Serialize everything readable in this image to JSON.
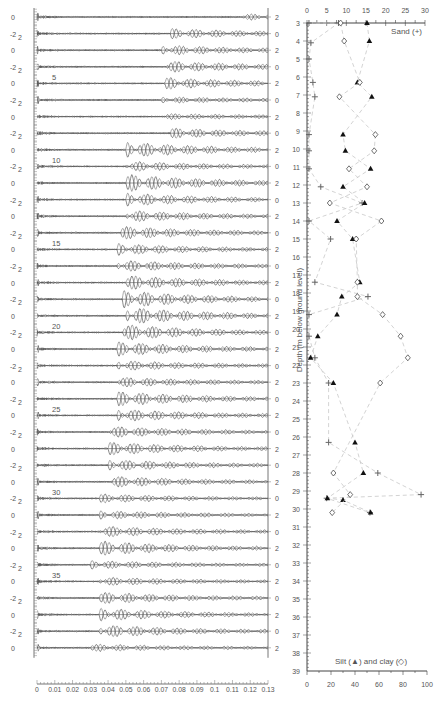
{
  "chart_data": [
    {
      "type": "line",
      "title": "",
      "description": "Stacked seismic waveform traces, one per depth (traces 1-39), amplitude axis -2..2 alternating left/right",
      "xlabel": "",
      "ylabel": "",
      "x_ticks": [
        "0",
        "0.01",
        "0.02",
        "0.03",
        "0.04",
        "0.05",
        "0.06",
        "0.07",
        "0.08",
        "0.09",
        "0.1",
        "0.11",
        "0.12",
        "0.13"
      ],
      "xlim": [
        0,
        0.13
      ],
      "amplitude_ticks": [
        "-2",
        "0",
        "2"
      ],
      "trace_count": 39,
      "trace_labels": [
        "5",
        "10",
        "15",
        "20",
        "25",
        "30",
        "35"
      ],
      "trace_label_indices": [
        5,
        10,
        15,
        20,
        25,
        30,
        35
      ],
      "arrival_time_per_trace": [
        0.115,
        0.075,
        0.07,
        0.072,
        0.072,
        0.07,
        0.07,
        0.075,
        0.05,
        0.05,
        0.05,
        0.05,
        0.05,
        0.047,
        0.045,
        0.045,
        0.05,
        0.048,
        0.05,
        0.048,
        0.045,
        0.045,
        0.045,
        0.045,
        0.045,
        0.04,
        0.04,
        0.04,
        0.04,
        0.035,
        0.035,
        0.035,
        0.035,
        0.03,
        0.035,
        0.035,
        0.035,
        0.035,
        0.03
      ],
      "energy_per_trace": [
        0.2,
        0.5,
        0.5,
        0.6,
        0.6,
        0.2,
        0.2,
        0.5,
        0.9,
        0.5,
        1.0,
        0.7,
        0.6,
        0.7,
        0.6,
        0.6,
        0.8,
        1.0,
        1.0,
        0.9,
        0.8,
        0.5,
        0.5,
        0.8,
        0.7,
        0.6,
        0.7,
        0.6,
        0.6,
        0.4,
        0.4,
        0.6,
        0.8,
        0.4,
        0.4,
        0.6,
        0.7,
        0.7,
        0.3
      ]
    },
    {
      "type": "scatter",
      "title": "",
      "ylabel": "Depth (m below ground level)",
      "ylim": [
        3,
        39
      ],
      "y_ticks": [
        "3",
        "4",
        "5",
        "6",
        "7",
        "8",
        "9",
        "10",
        "11",
        "12",
        "13",
        "14",
        "15",
        "16",
        "17",
        "18",
        "19",
        "20",
        "21",
        "22",
        "23",
        "24",
        "25",
        "26",
        "27",
        "28",
        "29",
        "30",
        "31",
        "32",
        "33",
        "34",
        "35",
        "36",
        "37",
        "38",
        "39"
      ],
      "top_axis": {
        "label": "Sand (+)",
        "range": [
          0,
          30
        ],
        "ticks": [
          "0",
          "5",
          "10",
          "15",
          "20",
          "25",
          "30"
        ]
      },
      "bottom_axis": {
        "label": "Silt (▲) and clay (◇)",
        "range": [
          0,
          100
        ],
        "ticks": [
          "0",
          "20",
          "40",
          "60",
          "80",
          "100"
        ]
      },
      "series": [
        {
          "name": "Sand (+)",
          "axis": "top",
          "marker": "plus",
          "points": [
            [
              0.5,
              3
            ],
            [
              8,
              3
            ],
            [
              1,
              4.1
            ],
            [
              0.5,
              5
            ],
            [
              1.5,
              6.3
            ],
            [
              2,
              7.1
            ],
            [
              0.5,
              9.2
            ],
            [
              0.5,
              10.1
            ],
            [
              0.5,
              11.1
            ],
            [
              3.5,
              12.1
            ],
            [
              14,
              13.0
            ],
            [
              0.5,
              14
            ],
            [
              6,
              15
            ],
            [
              2,
              17.4
            ],
            [
              15.5,
              18.2
            ],
            [
              0.5,
              19.2
            ],
            [
              0.5,
              20.4
            ],
            [
              2,
              21.6
            ],
            [
              5.5,
              23
            ],
            [
              5.5,
              26.3
            ],
            [
              18,
              28
            ],
            [
              29,
              29.2
            ],
            [
              5,
              29.4
            ],
            [
              16,
              30.2
            ]
          ]
        },
        {
          "name": "Silt (▲)",
          "axis": "bottom",
          "marker": "triangle",
          "points": [
            [
              50,
              3
            ],
            [
              52,
              4.0
            ],
            [
              42,
              6.3
            ],
            [
              54,
              7.1
            ],
            [
              30,
              9.2
            ],
            [
              32,
              10.1
            ],
            [
              53,
              11.1
            ],
            [
              30,
              12.1
            ],
            [
              48,
              13.0
            ],
            [
              25,
              14
            ],
            [
              38,
              15
            ],
            [
              44,
              17.4
            ],
            [
              29,
              18.2
            ],
            [
              25,
              19.2
            ],
            [
              9,
              20.4
            ],
            [
              3,
              21.6
            ],
            [
              22,
              23
            ],
            [
              40,
              26.3
            ],
            [
              47,
              28
            ],
            [
              17,
              29.4
            ],
            [
              30,
              29.5
            ],
            [
              53,
              30.2
            ]
          ]
        },
        {
          "name": "Clay (◇)",
          "axis": "bottom",
          "marker": "diamond",
          "points": [
            [
              28,
              3
            ],
            [
              31,
              4.0
            ],
            [
              44,
              6.3
            ],
            [
              27,
              7.1
            ],
            [
              57,
              9.2
            ],
            [
              56,
              10.1
            ],
            [
              35,
              11.1
            ],
            [
              50,
              12.1
            ],
            [
              19,
              13.0
            ],
            [
              62,
              14
            ],
            [
              41,
              15
            ],
            [
              42,
              17.4
            ],
            [
              42,
              18.2
            ],
            [
              63,
              19.2
            ],
            [
              78,
              20.4
            ],
            [
              84,
              21.6
            ],
            [
              61,
              23
            ],
            [
              22,
              28
            ],
            [
              36,
              29.2
            ],
            [
              21,
              30.2
            ]
          ]
        }
      ],
      "marker_color": "#111111",
      "line_color": "#c8c8c8"
    }
  ]
}
